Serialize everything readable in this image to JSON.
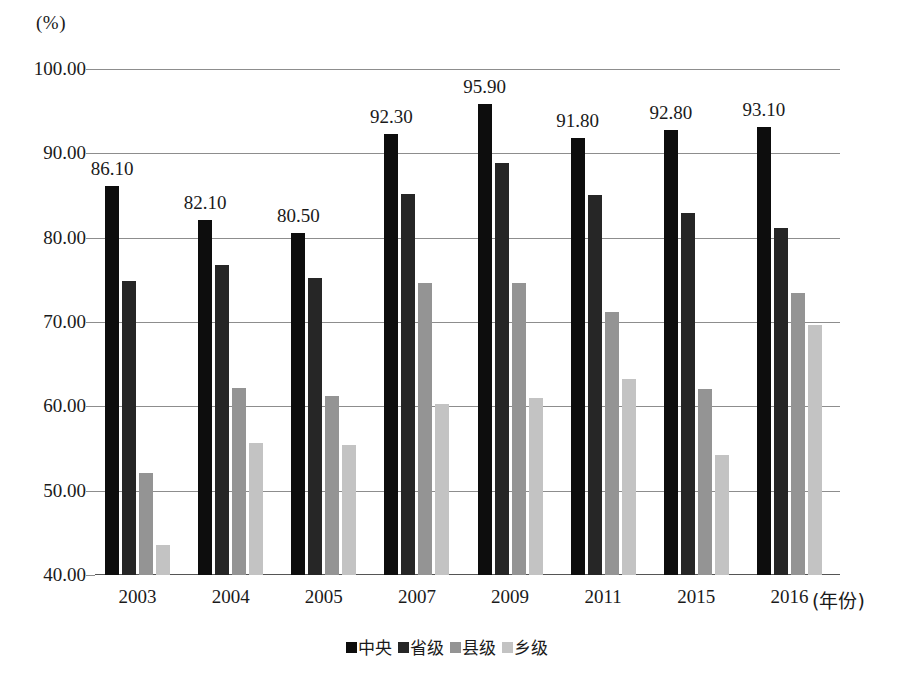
{
  "chart_data": {
    "type": "bar",
    "title": "",
    "subtitle": "",
    "unit_label": "(%)",
    "xlabel": "(年份)",
    "ylabel": "",
    "ylim": [
      40,
      100
    ],
    "ytick_step": 10,
    "yticks": [
      "100.00",
      "90.00",
      "80.00",
      "70.00",
      "60.00",
      "50.00",
      "40.00"
    ],
    "ytick_values": [
      100,
      90,
      80,
      70,
      60,
      50,
      40
    ],
    "grid": true,
    "legend_position": "bottom",
    "categories": [
      "2003",
      "2004",
      "2005",
      "2007",
      "2009",
      "2011",
      "2015",
      "2016"
    ],
    "series": [
      {
        "name": "中央",
        "color": "#0d0d0d",
        "values": [
          86.1,
          82.1,
          80.5,
          92.3,
          95.9,
          91.8,
          92.8,
          93.1
        ]
      },
      {
        "name": "省级",
        "color": "#262626",
        "values": [
          74.9,
          76.8,
          75.2,
          85.2,
          88.9,
          85.1,
          82.9,
          81.1
        ]
      },
      {
        "name": "县级",
        "color": "#949494",
        "values": [
          52.1,
          62.2,
          61.2,
          74.6,
          74.6,
          71.2,
          62.1,
          73.4
        ]
      },
      {
        "name": "乡级",
        "color": "#c3c3c3",
        "values": [
          43.6,
          55.7,
          55.4,
          60.3,
          61.0,
          63.3,
          54.2,
          69.7
        ]
      }
    ],
    "data_labels": {
      "series": "中央",
      "values": [
        "86.10",
        "82.10",
        "80.50",
        "92.30",
        "95.90",
        "91.80",
        "92.80",
        "93.10"
      ]
    }
  }
}
